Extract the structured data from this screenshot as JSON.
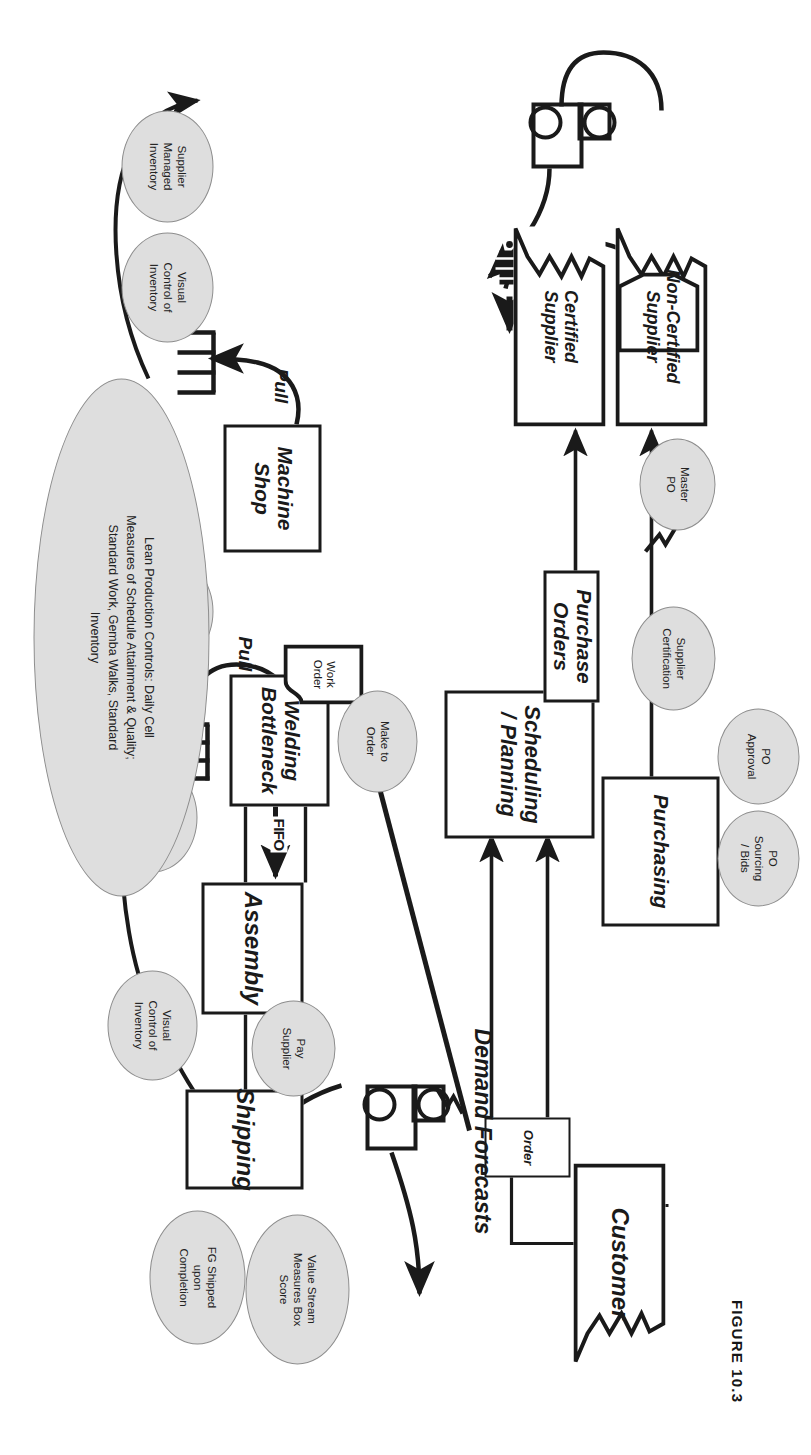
{
  "figure": {
    "caption": "FIGURE 10.3"
  },
  "colors": {
    "ink": "#1a1a1a",
    "ellipse_fill": "#dedede",
    "ellipse_stroke": "#8d8d8d",
    "page": "#ffffff"
  },
  "diagram": {
    "type": "value-stream-map",
    "external_entities": [
      {
        "id": "customer",
        "label": "Customer"
      },
      {
        "id": "non-certified-supplier",
        "label": "Non-Certified\nSupplier"
      },
      {
        "id": "certified-supplier",
        "label": "Certified\nSupplier"
      }
    ],
    "process_boxes": [
      {
        "id": "scheduling-planning",
        "label": "Scheduling\n/ Planning",
        "style": "italic"
      },
      {
        "id": "purchasing",
        "label": "Purchasing",
        "style": "italic"
      },
      {
        "id": "shipping",
        "label": "Shipping",
        "style": "italic"
      },
      {
        "id": "assembly",
        "label": "Assembly",
        "style": "italic"
      },
      {
        "id": "welding-bottleneck",
        "label": "Welding\nBottleneck",
        "style": "italic"
      },
      {
        "id": "machine-shop",
        "label": "Machine\nShop",
        "style": "italic"
      },
      {
        "id": "purchase-orders",
        "label": "Purchase Orders",
        "style": "italic"
      }
    ],
    "data_tags": [
      {
        "id": "order",
        "label": "Order"
      },
      {
        "id": "work-order",
        "label": "Work\nOrder"
      }
    ],
    "free_labels": [
      {
        "id": "demand-forecasts",
        "label": "Demand Forecasts"
      },
      {
        "id": "pull-welding",
        "label": "Pull"
      },
      {
        "id": "pull-machine",
        "label": "Pull"
      },
      {
        "id": "fifo-assembly-shipping",
        "label": "FIFO"
      },
      {
        "id": "fifo-welding-assembly",
        "label": "FIFO"
      }
    ],
    "callout_ellipses": [
      {
        "id": "value-stream-measures",
        "label": "Value Stream\nMeasures Box\nScore"
      },
      {
        "id": "fg-shipped",
        "label": "FG Shipped\nupon\nCompletion"
      },
      {
        "id": "pay-supplier",
        "label": "Pay\nSupplier"
      },
      {
        "id": "visual-control-1",
        "label": "Visual\nControl of\nInventory"
      },
      {
        "id": "visual-control-2",
        "label": "Visual\nControl of\nInventory"
      },
      {
        "id": "visual-control-3",
        "label": "Visual\nControl of\nInventory"
      },
      {
        "id": "visual-control-4",
        "label": "Visual\nControl of\nInventory"
      },
      {
        "id": "make-to-order",
        "label": "Make to\nOrder"
      },
      {
        "id": "po-sourcing-bids",
        "label": "PO\nSourcing\n/ Bids"
      },
      {
        "id": "po-approval",
        "label": "PO\nApproval"
      },
      {
        "id": "supplier-certification",
        "label": "Supplier\nCertification"
      },
      {
        "id": "master-po",
        "label": "Master\nPO"
      },
      {
        "id": "supplier-managed-inventory",
        "label": "Supplier\nManaged\nInventory"
      },
      {
        "id": "lean-production-controls",
        "label": "Lean Production Controls: Daily Cell\nMeasures of Schedule Attainment & Quality;\nStandard Work, Gemba Walks, Standard\nInventory"
      }
    ],
    "icons": [
      {
        "id": "truck-shipping",
        "name": "truck-icon"
      },
      {
        "id": "truck-supplier",
        "name": "truck-icon"
      },
      {
        "id": "kanban-welding",
        "name": "inventory-kanban-icon"
      },
      {
        "id": "kanban-machine",
        "name": "inventory-kanban-icon"
      },
      {
        "id": "go-see",
        "name": "go-see-eyeglasses-icon"
      },
      {
        "id": "push-arrow-order",
        "name": "push-arrow-icon"
      }
    ]
  }
}
